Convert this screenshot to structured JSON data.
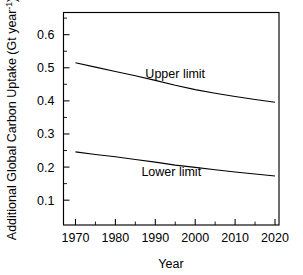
{
  "chart_data": {
    "type": "line",
    "title": "",
    "xlabel": "Year",
    "ylabel": "Additional Global Carbon Uptake (Gt year",
    "ylabel_superscript": "-1",
    "ylabel_suffix": ")",
    "xlim": [
      1967,
      2021
    ],
    "ylim": [
      0.025,
      0.667
    ],
    "grid": false,
    "legend_position": "inline-annotations",
    "x": [
      1970,
      1975,
      1980,
      1985,
      1990,
      1995,
      2000,
      2005,
      2010,
      2015,
      2020
    ],
    "xticks": [
      1970,
      1980,
      1990,
      2000,
      2010,
      2020
    ],
    "xtick_labels": [
      "1970",
      "1980",
      "1990",
      "2000",
      "2010",
      "2020"
    ],
    "xticks_minor": [
      1975,
      1985,
      1995,
      2005,
      2015
    ],
    "yticks": [
      0.1,
      0.2,
      0.3,
      0.4,
      0.5,
      0.6
    ],
    "ytick_labels": [
      "0.1",
      "0.2",
      "0.3",
      "0.4",
      "0.5",
      "0.6"
    ],
    "yticks_minor": [
      0.15,
      0.25,
      0.35,
      0.45,
      0.55,
      0.65
    ],
    "series": [
      {
        "name": "Upper limit",
        "label": "Upper limit",
        "label_x": 1995,
        "label_y": 0.468,
        "values": [
          0.515,
          0.502,
          0.489,
          0.476,
          0.462,
          0.447,
          0.434,
          0.423,
          0.413,
          0.404,
          0.396
        ]
      },
      {
        "name": "Lower limit",
        "label": "Lower limit",
        "label_x": 1994,
        "label_y": 0.172,
        "values": [
          0.246,
          0.238,
          0.231,
          0.223,
          0.215,
          0.206,
          0.199,
          0.192,
          0.185,
          0.179,
          0.173
        ]
      }
    ]
  }
}
